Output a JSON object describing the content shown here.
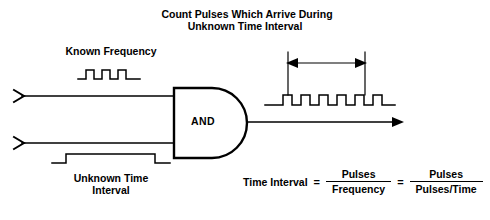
{
  "diagram": {
    "title_lines": [
      "Count Pulses Which Arrive During",
      "Unknown Time Interval"
    ],
    "labels": {
      "known_frequency": "Known Frequency",
      "unknown_time_interval_line1": "Unknown Time",
      "unknown_time_interval_line2": "Interval",
      "gate": "AND"
    },
    "formula": {
      "lhs": "Time Interval",
      "equals_1": "=",
      "fraction_1": {
        "numerator": "Pulses",
        "denominator": "Frequency"
      },
      "equals_2": "=",
      "fraction_2": {
        "numerator": "Pulses",
        "denominator": "Pulses/Time"
      }
    },
    "signals": {
      "known_frequency_pulse_count": 3,
      "gate_pulse_count": 1,
      "output_pulse_count": 6
    },
    "colors": {
      "ink": "#000000",
      "background": "#ffffff"
    }
  }
}
